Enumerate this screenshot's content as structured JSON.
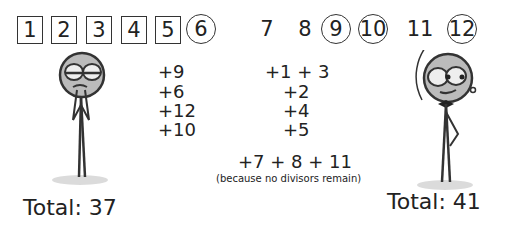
{
  "numbers": [
    {
      "value": "1",
      "style": "box"
    },
    {
      "value": "2",
      "style": "box"
    },
    {
      "value": "3",
      "style": "box"
    },
    {
      "value": "4",
      "style": "box"
    },
    {
      "value": "5",
      "style": "box"
    },
    {
      "value": "6",
      "style": "circle"
    },
    {
      "value": "7",
      "style": "plain"
    },
    {
      "value": "8",
      "style": "plain"
    },
    {
      "value": "9",
      "style": "circle"
    },
    {
      "value": "10",
      "style": "circle"
    },
    {
      "value": "11",
      "style": "plain"
    },
    {
      "value": "12",
      "style": "circle"
    }
  ],
  "left_moves": [
    "+9",
    "+6",
    "+12",
    "+10"
  ],
  "right_moves": [
    "+1 + 3",
    "+2",
    "+4",
    "+5",
    "+7 + 8 + 11"
  ],
  "right_note": "(because no divisors remain)",
  "left_total": "Total: 37",
  "right_total": "Total: 41",
  "characters": {
    "left": "sad-stick-figure",
    "right": "smug-stick-figure"
  }
}
